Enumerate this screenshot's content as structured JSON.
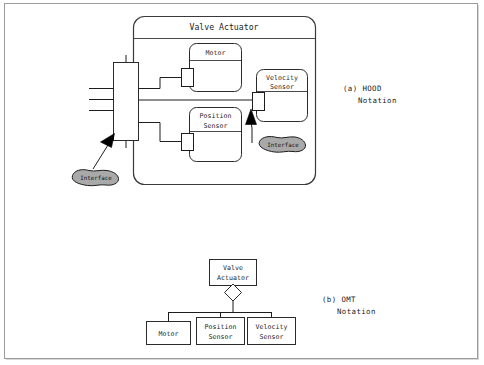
{
  "figure": {
    "hood": {
      "caption_line1": "(a) HOOD",
      "caption_line2": "Notation",
      "root_label": "Valve Actuator",
      "children": [
        {
          "name": "motor",
          "label": "Motor"
        },
        {
          "name": "position-sensor",
          "label_line1": "Position",
          "label_line2": "Sensor"
        },
        {
          "name": "velocity-sensor",
          "label_line1": "Velocity",
          "label_line2": "Sensor"
        }
      ],
      "interface_outer_label": "Interface",
      "interface_inner_label": "Interface"
    },
    "omt": {
      "caption_line1": "(b) OMT",
      "caption_line2": "Notation",
      "root_label_line1": "Valve",
      "root_label_line2": "Actuator",
      "aggregation_symbol": "diamond",
      "children": [
        {
          "name": "motor",
          "label_line1": "Motor",
          "label_line2": ""
        },
        {
          "name": "position-sensor",
          "label_line1": "Position",
          "label_line2": "Sensor"
        },
        {
          "name": "velocity-sensor",
          "label_line1": "Velocity",
          "label_line2": "Sensor"
        }
      ]
    }
  },
  "colors": {
    "blob_fill": "#a9a9a9",
    "stroke": "#1d1d1d",
    "frame": "#9a9a9a",
    "background": "#ffffff"
  }
}
